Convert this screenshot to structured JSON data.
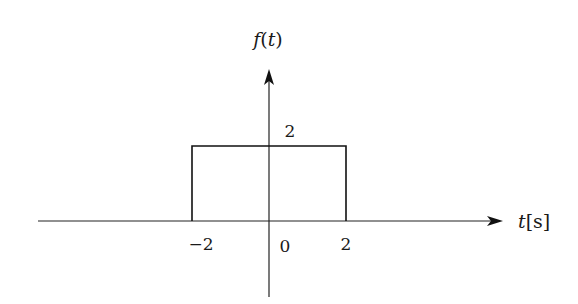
{
  "chart_data": {
    "type": "line",
    "title": "",
    "ylabel": "f(t)",
    "xlabel_var": "t",
    "xlabel_unit": "[s]",
    "x_tick_labels": [
      "−2",
      "0",
      "2"
    ],
    "y_tick_labels": [
      "2"
    ],
    "series": [
      {
        "name": "f(t)",
        "points": [
          [
            -2,
            0
          ],
          [
            -2,
            2
          ],
          [
            2,
            2
          ],
          [
            2,
            0
          ]
        ]
      }
    ],
    "xlim": [
      -3.5,
      3.2
    ],
    "ylim": [
      -1.0,
      2.0
    ]
  },
  "labels": {
    "f": "f",
    "paren_open": "(",
    "t": "t",
    "paren_close": ")",
    "height": "2",
    "neg_two": "−2",
    "zero": "0",
    "pos_two": "2",
    "t_axis": "t",
    "unit": "[s]"
  }
}
